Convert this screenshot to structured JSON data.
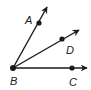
{
  "diagram": {
    "type": "geometry-rays",
    "color": "#1a1a1a",
    "vertex": {
      "label": "B",
      "x": 13,
      "y": 68,
      "label_x": 10,
      "label_y": 85
    },
    "rays": [
      {
        "name": "ray-BA",
        "point": {
          "label": "A",
          "x": 39,
          "y": 23,
          "label_x": 25,
          "label_y": 24
        },
        "tip": {
          "x": 47,
          "y": 7
        }
      },
      {
        "name": "ray-BD",
        "point": {
          "label": "D",
          "x": 62,
          "y": 39,
          "label_x": 66,
          "label_y": 54
        },
        "tip": {
          "x": 79,
          "y": 30
        }
      },
      {
        "name": "ray-BC",
        "point": {
          "label": "C",
          "x": 72,
          "y": 68,
          "label_x": 69,
          "label_y": 86
        },
        "tip": {
          "x": 87,
          "y": 68
        }
      }
    ]
  }
}
